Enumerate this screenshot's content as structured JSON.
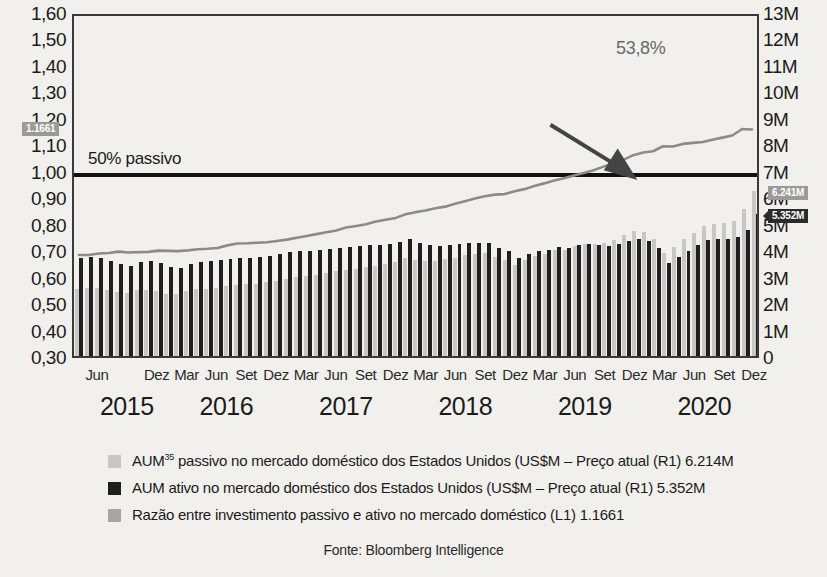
{
  "chart_data": {
    "type": "bar",
    "title": "",
    "subtitle": "",
    "xlabel": "",
    "ylabel": "",
    "grid": false,
    "legend_position": "bottom-left",
    "left_axis": {
      "label": "",
      "ticks": [
        "1,60",
        "1,50",
        "1,40",
        "1,30",
        "1,20",
        "1,10",
        "1,00",
        "0,90",
        "0,80",
        "0,70",
        "0,60",
        "0,50",
        "0,40",
        "0,30"
      ],
      "values": [
        1.6,
        1.5,
        1.4,
        1.3,
        1.2,
        1.1,
        1.0,
        0.9,
        0.8,
        0.7,
        0.6,
        0.5,
        0.4,
        0.3
      ],
      "ylim": [
        0.3,
        1.6
      ]
    },
    "right_axis": {
      "label": "",
      "ticks": [
        "13M",
        "12M",
        "11M",
        "10M",
        "9M",
        "8M",
        "7M",
        "6M",
        "5M",
        "4M",
        "3M",
        "2M",
        "1M",
        "0"
      ],
      "values": [
        13000000,
        12000000,
        11000000,
        10000000,
        9000000,
        8000000,
        7000000,
        6000000,
        5000000,
        4000000,
        3000000,
        2000000,
        1000000,
        0
      ],
      "ylim": [
        0,
        13000000
      ]
    },
    "reference_line": {
      "label": "50% passivo",
      "value": 1.0
    },
    "annotation": {
      "text": "53,8%",
      "has_arrow": true
    },
    "badges": [
      {
        "text": "1.1661",
        "axis": "left",
        "value": 1.1661,
        "style": "gray"
      },
      {
        "text": "6.241M",
        "axis": "right",
        "value": 6241000,
        "style": "gray"
      },
      {
        "text": "5.352M",
        "axis": "right",
        "value": 5352000,
        "style": "dark"
      }
    ],
    "years": [
      "2015",
      "2016",
      "2017",
      "2018",
      "2019",
      "2020"
    ],
    "months": [
      "Jun",
      "Dez",
      "Mar",
      "Jun",
      "Set",
      "Dez",
      "Mar",
      "Jun",
      "Set",
      "Dez",
      "Mar",
      "Jun",
      "Set",
      "Dez",
      "Mar",
      "Jun",
      "Set",
      "Dez",
      "Mar",
      "Jun",
      "Set",
      "Dez"
    ],
    "categories": [
      "2015-04",
      "2015-05",
      "2015-06",
      "2015-07",
      "2015-08",
      "2015-09",
      "2015-10",
      "2015-11",
      "2015-12",
      "2016-01",
      "2016-02",
      "2016-03",
      "2016-04",
      "2016-05",
      "2016-06",
      "2016-07",
      "2016-08",
      "2016-09",
      "2016-10",
      "2016-11",
      "2016-12",
      "2017-01",
      "2017-02",
      "2017-03",
      "2017-04",
      "2017-05",
      "2017-06",
      "2017-07",
      "2017-08",
      "2017-09",
      "2017-10",
      "2017-11",
      "2017-12",
      "2018-01",
      "2018-02",
      "2018-03",
      "2018-04",
      "2018-05",
      "2018-06",
      "2018-07",
      "2018-08",
      "2018-09",
      "2018-10",
      "2018-11",
      "2018-12",
      "2019-01",
      "2019-02",
      "2019-03",
      "2019-04",
      "2019-05",
      "2019-06",
      "2019-07",
      "2019-08",
      "2019-09",
      "2019-10",
      "2019-11",
      "2019-12",
      "2020-01",
      "2020-02",
      "2020-03",
      "2020-04",
      "2020-05",
      "2020-06",
      "2020-07",
      "2020-08",
      "2020-09",
      "2020-10",
      "2020-11",
      "2020-12"
    ],
    "series": [
      {
        "name": "AUM passivo no mercado doméstico dos Estados Unidos",
        "key": "passive",
        "type": "bar",
        "axis": "right",
        "color": "#c9c7c4",
        "unit": "M",
        "values": [
          2.55,
          2.58,
          2.56,
          2.5,
          2.42,
          2.38,
          2.48,
          2.5,
          2.46,
          2.36,
          2.34,
          2.45,
          2.52,
          2.54,
          2.58,
          2.66,
          2.7,
          2.72,
          2.74,
          2.78,
          2.84,
          2.92,
          2.98,
          3.02,
          3.08,
          3.14,
          3.2,
          3.26,
          3.3,
          3.36,
          3.42,
          3.48,
          3.56,
          3.72,
          3.62,
          3.58,
          3.6,
          3.66,
          3.72,
          3.8,
          3.86,
          3.88,
          3.74,
          3.64,
          3.44,
          3.62,
          3.78,
          3.84,
          4.0,
          4.02,
          4.14,
          4.22,
          4.22,
          4.26,
          4.38,
          4.58,
          4.72,
          4.68,
          4.44,
          3.88,
          4.12,
          4.42,
          4.66,
          4.92,
          4.98,
          5.04,
          5.12,
          5.56,
          6.24
        ]
      },
      {
        "name": "AUM ativo no mercado doméstico dos Estados Unidos",
        "key": "active",
        "type": "bar",
        "axis": "right",
        "color": "#1f1f1f",
        "unit": "M",
        "values": [
          3.72,
          3.76,
          3.7,
          3.6,
          3.46,
          3.42,
          3.56,
          3.58,
          3.5,
          3.36,
          3.34,
          3.48,
          3.56,
          3.58,
          3.62,
          3.68,
          3.7,
          3.72,
          3.74,
          3.78,
          3.84,
          3.92,
          3.96,
          3.98,
          4.02,
          4.06,
          4.1,
          4.12,
          4.14,
          4.18,
          4.2,
          4.24,
          4.3,
          4.42,
          4.26,
          4.18,
          4.16,
          4.2,
          4.22,
          4.26,
          4.28,
          4.26,
          4.08,
          3.96,
          3.7,
          3.86,
          3.98,
          4.0,
          4.12,
          4.1,
          4.18,
          4.22,
          4.18,
          4.16,
          4.22,
          4.36,
          4.42,
          4.34,
          4.1,
          3.52,
          3.74,
          3.98,
          4.18,
          4.4,
          4.42,
          4.44,
          4.48,
          4.76,
          5.35
        ]
      },
      {
        "name": "Razão entre investimento passivo e ativo no mercado doméstico",
        "key": "ratio",
        "type": "line",
        "axis": "left",
        "color": "#8d8b88",
        "values": [
          0.686,
          0.686,
          0.692,
          0.694,
          0.699,
          0.696,
          0.697,
          0.698,
          0.703,
          0.702,
          0.701,
          0.704,
          0.708,
          0.71,
          0.713,
          0.723,
          0.73,
          0.731,
          0.733,
          0.735,
          0.74,
          0.745,
          0.752,
          0.759,
          0.766,
          0.773,
          0.78,
          0.791,
          0.797,
          0.804,
          0.814,
          0.821,
          0.828,
          0.842,
          0.85,
          0.856,
          0.865,
          0.871,
          0.882,
          0.892,
          0.902,
          0.911,
          0.917,
          0.919,
          0.93,
          0.938,
          0.95,
          0.96,
          0.971,
          0.98,
          0.99,
          1.0,
          1.01,
          1.024,
          1.038,
          1.05,
          1.068,
          1.078,
          1.083,
          1.102,
          1.101,
          1.111,
          1.115,
          1.118,
          1.127,
          1.135,
          1.143,
          1.168,
          1.166
        ]
      }
    ],
    "legend": [
      {
        "swatch": "passive",
        "text_prefix": "AUM",
        "superscript": "35",
        "text": " passivo no mercado doméstico dos Estados Unidos (US$M – Preço atual (R1) 6.214M"
      },
      {
        "swatch": "active",
        "text_prefix": "",
        "superscript": "",
        "text": "AUM ativo no mercado doméstico dos Estados Unidos (US$M – Preço atual (R1) 5.352M"
      },
      {
        "swatch": "ratio",
        "text_prefix": "",
        "superscript": "",
        "text": "Razão entre investimento passivo e ativo no mercado doméstico (L1) 1.1661"
      }
    ],
    "source": "Fonte: Bloomberg Intelligence",
    "colors": {
      "passive": "#c9c7c4",
      "active": "#1f1f1f",
      "ratio": "#8d8b88",
      "reference_line": "#111111",
      "background": "#f2f0ed"
    }
  }
}
